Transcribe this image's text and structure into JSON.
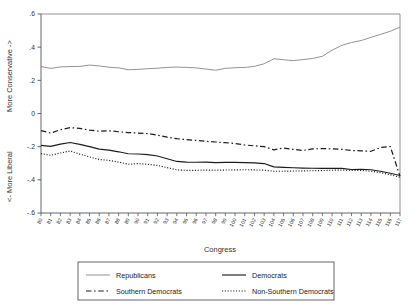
{
  "chart_data": {
    "type": "line",
    "title": "",
    "xlabel": "Congress",
    "ylabel_upper": "More Conservative ->",
    "ylabel_lower": "<- More Liberal",
    "ylim": [
      -0.6,
      0.6
    ],
    "yticks": [
      0.6,
      0.4,
      0.2,
      0,
      -0.2,
      -0.4,
      -0.6
    ],
    "ytick_labels": [
      ".6",
      ".4",
      ".2",
      "0",
      "-.2",
      "-.4",
      "-.6"
    ],
    "grid": false,
    "legend_position": "bottom",
    "x": [
      80,
      81,
      82,
      83,
      84,
      85,
      86,
      87,
      88,
      89,
      90,
      91,
      92,
      93,
      94,
      95,
      96,
      97,
      98,
      99,
      100,
      101,
      102,
      103,
      104,
      105,
      106,
      107,
      108,
      109,
      110,
      111,
      112,
      113,
      114,
      115,
      116,
      117
    ],
    "xtick_labels": [
      "80",
      "81",
      "82",
      "83",
      "84",
      "85",
      "86",
      "87",
      "88",
      "89",
      "90",
      "91",
      "92",
      "93",
      "94",
      "95",
      "96",
      "97",
      "98",
      "99",
      "100",
      "101",
      "102",
      "103",
      "104",
      "105",
      "106",
      "107",
      "108",
      "109",
      "110",
      "111",
      "112",
      "113",
      "114",
      "115",
      "116",
      "117"
    ],
    "series": [
      {
        "name": "Republicans",
        "style": "solid-thin",
        "color": "#6f6f6f",
        "values": [
          0.283,
          0.272,
          0.281,
          0.283,
          0.284,
          0.292,
          0.287,
          0.279,
          0.275,
          0.264,
          0.266,
          0.27,
          0.273,
          0.278,
          0.28,
          0.278,
          0.275,
          0.268,
          0.261,
          0.272,
          0.276,
          0.278,
          0.284,
          0.3,
          0.33,
          0.324,
          0.319,
          0.325,
          0.332,
          0.345,
          0.382,
          0.411,
          0.428,
          0.44,
          0.459,
          0.477,
          0.496,
          0.521
        ]
      },
      {
        "name": "Democrats",
        "style": "solid-thick",
        "color": "#1c1c1c",
        "values": [
          -0.192,
          -0.198,
          -0.185,
          -0.175,
          -0.186,
          -0.2,
          -0.215,
          -0.221,
          -0.231,
          -0.243,
          -0.244,
          -0.248,
          -0.256,
          -0.273,
          -0.289,
          -0.293,
          -0.294,
          -0.293,
          -0.296,
          -0.295,
          -0.295,
          -0.296,
          -0.298,
          -0.302,
          -0.322,
          -0.325,
          -0.327,
          -0.329,
          -0.33,
          -0.331,
          -0.33,
          -0.331,
          -0.338,
          -0.336,
          -0.339,
          -0.348,
          -0.36,
          -0.374
        ]
      },
      {
        "name": "Southern Democrats",
        "style": "dashdot",
        "color": "#1c1c1c",
        "values": [
          -0.103,
          -0.118,
          -0.098,
          -0.085,
          -0.09,
          -0.1,
          -0.107,
          -0.104,
          -0.11,
          -0.115,
          -0.118,
          -0.121,
          -0.13,
          -0.143,
          -0.152,
          -0.158,
          -0.162,
          -0.168,
          -0.172,
          -0.176,
          -0.181,
          -0.19,
          -0.195,
          -0.2,
          -0.219,
          -0.208,
          -0.216,
          -0.223,
          -0.213,
          -0.212,
          -0.213,
          -0.216,
          -0.223,
          -0.225,
          -0.228,
          -0.205,
          -0.199,
          -0.378
        ]
      },
      {
        "name": "Non-Southern Democrats",
        "style": "dotted",
        "color": "#1c1c1c",
        "values": [
          -0.242,
          -0.252,
          -0.238,
          -0.226,
          -0.245,
          -0.262,
          -0.277,
          -0.283,
          -0.293,
          -0.306,
          -0.302,
          -0.306,
          -0.313,
          -0.326,
          -0.34,
          -0.343,
          -0.343,
          -0.341,
          -0.342,
          -0.341,
          -0.34,
          -0.339,
          -0.34,
          -0.342,
          -0.348,
          -0.348,
          -0.347,
          -0.346,
          -0.345,
          -0.344,
          -0.342,
          -0.341,
          -0.343,
          -0.343,
          -0.348,
          -0.357,
          -0.37,
          -0.384
        ]
      }
    ]
  },
  "legend": {
    "entries": [
      {
        "label": "Republicans",
        "style": "solid-thin"
      },
      {
        "label": "Democrats",
        "style": "solid-thick"
      },
      {
        "label": "Southern Democrats",
        "style": "dashdot"
      },
      {
        "label": "Non-Southern Democrats",
        "style": "dotted"
      }
    ]
  }
}
